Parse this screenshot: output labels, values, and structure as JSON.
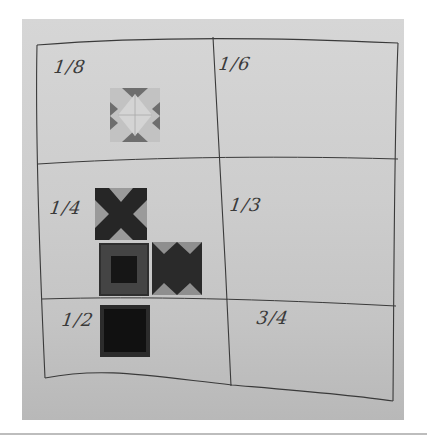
{
  "image": {
    "description": "Photo of a whiteboard with a hand-drawn 2x3 grid, cells labeled with fractions, and paper quilt-block tiles placed in some cells",
    "background_color": "#cdcdcd",
    "ink_color": "#3a3a3a"
  },
  "grid": {
    "columns": 2,
    "rows": 3,
    "cells": [
      {
        "row": 0,
        "col": 0,
        "label": "1/8"
      },
      {
        "row": 0,
        "col": 1,
        "label": "1/6"
      },
      {
        "row": 1,
        "col": 0,
        "label": "1/4"
      },
      {
        "row": 1,
        "col": 1,
        "label": "1/3"
      },
      {
        "row": 2,
        "col": 0,
        "label": "1/2"
      },
      {
        "row": 2,
        "col": 1,
        "label": "3/4"
      }
    ]
  },
  "tiles": [
    {
      "cell": "1/8",
      "pattern": "light star / diamond block",
      "dominant_color": "#b5b5b5"
    },
    {
      "cell": "1/4",
      "pattern": "dark X block",
      "dominant_color": "#2a2a2a"
    },
    {
      "cell": "1/4",
      "pattern": "square-in-square block",
      "dominant_color": "#3b3b3b"
    },
    {
      "cell": "1/4",
      "pattern": "zigzag block",
      "dominant_color": "#2c2c2c"
    },
    {
      "cell": "1/2",
      "pattern": "dark square with thin border",
      "dominant_color": "#151515"
    }
  ]
}
